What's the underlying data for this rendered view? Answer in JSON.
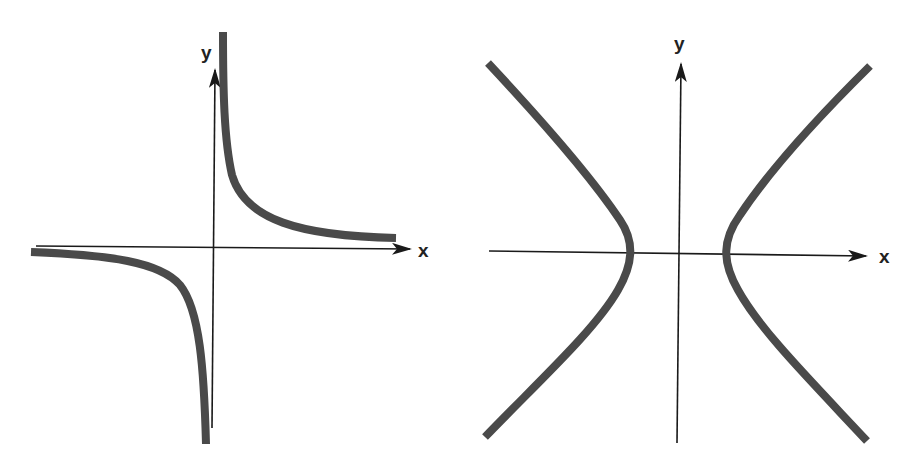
{
  "figures": [
    {
      "id": "left",
      "description": "Rectangular hyperbola y = k/x with asymptotes on the coordinate axes",
      "axis_labels": {
        "x": "x",
        "y": "y"
      },
      "curve_color": "#4a4a4a",
      "axis_color": "#1a1a1a"
    },
    {
      "id": "right",
      "description": "Hyperbola x^2/a^2 - y^2/b^2 = 1 opening left and right",
      "axis_labels": {
        "x": "x",
        "y": "y"
      },
      "curve_color": "#4a4a4a",
      "axis_color": "#1a1a1a"
    }
  ]
}
